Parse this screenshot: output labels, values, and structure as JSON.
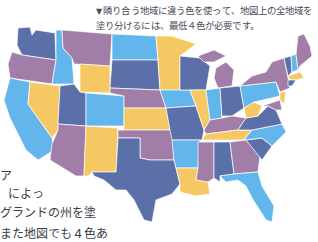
{
  "caption": {
    "marker": "▼",
    "line1": "隣り合う地域に違う色を使って、地図上の全地域を",
    "line2": "塗り分けるには、最低４色が必要です。"
  },
  "body_text": {
    "line1": "ア",
    "line2": "によっ",
    "line3": "グランドの州を塗",
    "line4": "また地図でも４色あ"
  },
  "map": {
    "title": "United States four-color map",
    "colors": {
      "purple": "#a07ea8",
      "navy": "#5b6fa8",
      "sky": "#62b6ec",
      "yellow": "#f5c863"
    }
  }
}
